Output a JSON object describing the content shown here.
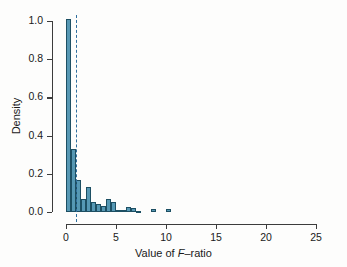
{
  "chart_data": {
    "type": "bar",
    "title": "",
    "subtitle": "",
    "xlabel_prefix": "Value of ",
    "xlabel_italic": "F",
    "xlabel_suffix": "–ratio",
    "xlabel": "Value of F–ratio",
    "ylabel": "Density",
    "xlim": [
      0,
      25
    ],
    "ylim": [
      0,
      1.0
    ],
    "xticks": [
      0,
      5,
      10,
      15,
      20,
      25
    ],
    "xticklabels": [
      "0",
      "5",
      "10",
      "15",
      "20",
      "25"
    ],
    "yticks": [
      0.0,
      0.2,
      0.4,
      0.6,
      0.8,
      1.0
    ],
    "yticklabels": [
      "0.0",
      "0.2",
      "0.4",
      "0.6",
      "0.8",
      "1.0"
    ],
    "grid": false,
    "legend": null,
    "bin_width": 0.5,
    "bar_fill_color": "#5698b4",
    "bar_edge_color": "#1d4f63",
    "annotation_line": {
      "name": "critical-value-line",
      "orientation": "vertical",
      "x": 1.0,
      "style": "dashed",
      "color": "#2f6f9e"
    },
    "bins": [
      {
        "x0": 0.0,
        "x1": 0.5,
        "density": 1.01
      },
      {
        "x0": 0.5,
        "x1": 1.0,
        "density": 0.33
      },
      {
        "x0": 1.0,
        "x1": 1.5,
        "density": 0.17
      },
      {
        "x0": 1.5,
        "x1": 2.0,
        "density": 0.07
      },
      {
        "x0": 2.0,
        "x1": 2.5,
        "density": 0.13
      },
      {
        "x0": 2.5,
        "x1": 3.0,
        "density": 0.05
      },
      {
        "x0": 3.0,
        "x1": 3.5,
        "density": 0.04
      },
      {
        "x0": 3.5,
        "x1": 4.0,
        "density": 0.03
      },
      {
        "x0": 4.0,
        "x1": 4.5,
        "density": 0.07
      },
      {
        "x0": 4.5,
        "x1": 5.0,
        "density": 0.05
      },
      {
        "x0": 5.0,
        "x1": 5.5,
        "density": 0.01
      },
      {
        "x0": 5.5,
        "x1": 6.0,
        "density": 0.01
      },
      {
        "x0": 6.0,
        "x1": 6.5,
        "density": 0.025
      },
      {
        "x0": 6.5,
        "x1": 7.0,
        "density": 0.02
      },
      {
        "x0": 7.0,
        "x1": 7.5,
        "density": 0.005
      },
      {
        "x0": 8.5,
        "x1": 9.0,
        "density": 0.018
      },
      {
        "x0": 10.0,
        "x1": 10.5,
        "density": 0.017
      }
    ]
  }
}
